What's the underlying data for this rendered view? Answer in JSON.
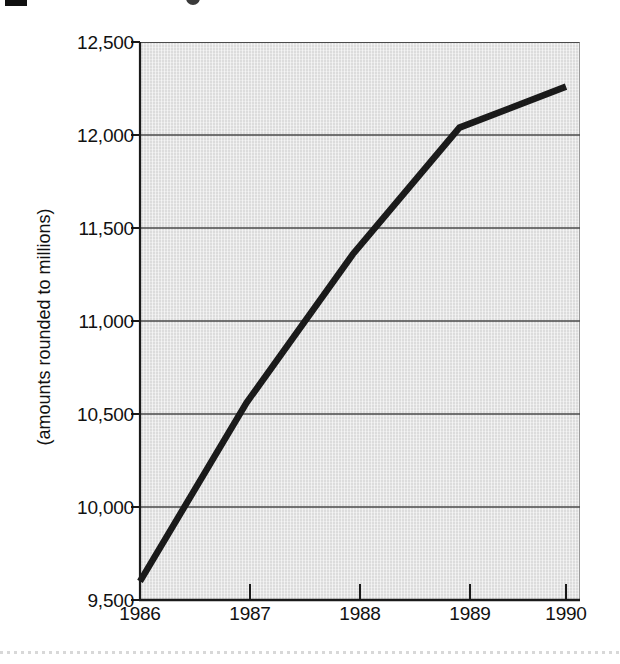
{
  "chart_data": {
    "type": "line",
    "title": "",
    "subtitle": "",
    "xlabel": "",
    "ylabel": "(amounts rounded to millions)",
    "x": [
      1986,
      1987,
      1988,
      1989,
      1990
    ],
    "categories": [
      "1986",
      "1987",
      "1988",
      "1989",
      "1990"
    ],
    "values": [
      9600,
      10560,
      11360,
      12040,
      12260
    ],
    "series": [
      {
        "name": "",
        "values": [
          9600,
          10560,
          11360,
          12040,
          12260
        ]
      }
    ],
    "xlim": [
      1986,
      1990
    ],
    "ylim": [
      9500,
      12500
    ],
    "y_ticks": [
      9500,
      10000,
      10500,
      11000,
      11500,
      12000,
      12500
    ],
    "y_tick_labels": [
      "9,500",
      "10,000",
      "10,500",
      "11,000",
      "11,500",
      "12,000",
      "12,500"
    ],
    "x_ticks": [
      1986,
      1987,
      1988,
      1989,
      1990
    ],
    "x_tick_labels": [
      "1986",
      "1987",
      "1988",
      "1989",
      "1990"
    ],
    "grid": "horizontal",
    "legend": "none",
    "annotations": []
  },
  "style": {
    "plot_background": "#dcdcdc",
    "line_color": "#1a1a1a",
    "gridline_color": "#4a4a4a",
    "axis_color": "#1a1a1a",
    "text_color": "#111111",
    "page_background": "#ffffff"
  },
  "artifacts": {
    "top_block": "cropped-black-mark",
    "top_glyph": "cropped-character",
    "bottom_line": "scan-edge-dotted-line"
  }
}
